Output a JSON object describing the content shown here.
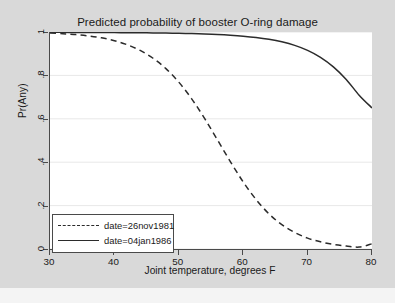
{
  "chart_data": {
    "type": "line",
    "title": "Predicted probability of booster O-ring damage",
    "xlabel": "Joint temperature, degrees F",
    "ylabel": "Pr(Any)",
    "xlim": [
      30,
      80
    ],
    "ylim": [
      0,
      1
    ],
    "xticks": [
      30,
      40,
      50,
      60,
      70,
      80
    ],
    "xticklabels": [
      "30",
      "40",
      "50",
      "60",
      "70",
      "80"
    ],
    "yticks": [
      0,
      0.2,
      0.4,
      0.6,
      0.8,
      1
    ],
    "yticklabels": [
      "0",
      ".2",
      ".4",
      ".6",
      ".8",
      "1"
    ],
    "grid": "horizontal",
    "legend_position": "lower-left",
    "series": [
      {
        "name": "date=26nov1981",
        "style": "dashed",
        "color": "#2b2b2b",
        "x": [
          30,
          32,
          34,
          36,
          38,
          40,
          42,
          44,
          46,
          48,
          50,
          52,
          54,
          56,
          58,
          60,
          62,
          64,
          66,
          68,
          70,
          72,
          74,
          76,
          78,
          80
        ],
        "y": [
          0.995,
          0.992,
          0.988,
          0.982,
          0.973,
          0.96,
          0.941,
          0.915,
          0.879,
          0.831,
          0.769,
          0.692,
          0.602,
          0.503,
          0.403,
          0.309,
          0.228,
          0.162,
          0.112,
          0.076,
          0.05,
          0.033,
          0.021,
          0.014,
          0.009,
          0.024
        ]
      },
      {
        "name": "date=04jan1986",
        "style": "solid",
        "color": "#2b2b2b",
        "x": [
          30,
          32,
          34,
          36,
          38,
          40,
          42,
          44,
          46,
          48,
          50,
          52,
          54,
          56,
          58,
          60,
          62,
          64,
          66,
          68,
          70,
          72,
          74,
          76,
          78,
          80
        ],
        "y": [
          0.9985,
          0.9983,
          0.9981,
          0.9979,
          0.9976,
          0.9973,
          0.9969,
          0.9964,
          0.9958,
          0.995,
          0.994,
          0.9926,
          0.9908,
          0.9884,
          0.9851,
          0.9807,
          0.9747,
          0.9663,
          0.9546,
          0.9382,
          0.9153,
          0.8833,
          0.8395,
          0.7815,
          0.709,
          0.65
        ]
      }
    ]
  },
  "legend": {
    "items": [
      {
        "label": "date=26nov1981",
        "style": "dashed"
      },
      {
        "label": "date=04jan1986",
        "style": "solid"
      }
    ]
  },
  "colors": {
    "figure_background": "#d9d9d9",
    "plot_background": "#ffffff",
    "axis": "#4a4a4a",
    "gridline": "#e8e8e8",
    "curve": "#2b2b2b",
    "text": "#1a1a1a"
  }
}
